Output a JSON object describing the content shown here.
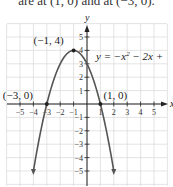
{
  "caption_fragment": "are at (1, 0) and at (−3, 0).",
  "chart_data": {
    "type": "line",
    "title": "",
    "equation_label": "y = −x² − 2x + 3",
    "equation_visible": "y = −x",
    "equation_rest": " − 2x +",
    "xlabel": "x",
    "ylabel": "y",
    "xlim": [
      -6,
      6
    ],
    "ylim": [
      -6,
      6
    ],
    "grid": true,
    "x_ticks": [
      -5,
      -4,
      -3,
      -2,
      -1,
      1,
      2,
      3,
      4,
      5
    ],
    "y_ticks": [
      -5,
      -4,
      -3,
      -2,
      -1,
      1,
      2,
      3,
      4,
      5
    ],
    "series": [
      {
        "name": "y = -x^2 - 2x + 3",
        "x": [
          -4,
          -3.5,
          -3,
          -2.5,
          -2,
          -1.5,
          -1,
          -0.5,
          0,
          0.5,
          1,
          1.5,
          2
        ],
        "y": [
          -5,
          -2.25,
          0,
          1.75,
          3,
          3.75,
          4,
          3.75,
          3,
          1.75,
          0,
          -2.25,
          -5
        ]
      }
    ],
    "annotations": [
      {
        "label": "(−1, 4)",
        "x": -1,
        "y": 4,
        "kind": "vertex"
      },
      {
        "label": "(−3, 0)",
        "x": -3,
        "y": 0,
        "kind": "x-intercept"
      },
      {
        "label": "(1, 0)",
        "x": 1,
        "y": 0,
        "kind": "x-intercept"
      }
    ],
    "colors": {
      "curve": "#555555",
      "grid": "#d9d9d9",
      "axis": "#222222"
    }
  }
}
